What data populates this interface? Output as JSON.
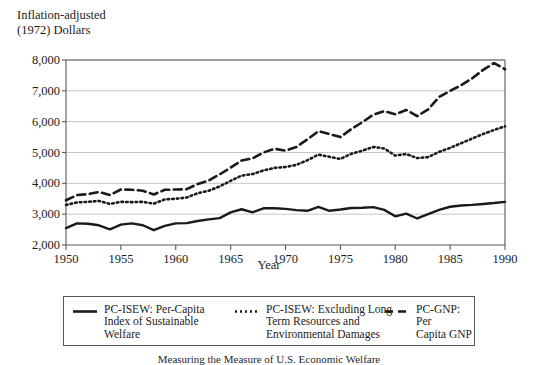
{
  "axes": {
    "ylabel_line1": "Inflation-adjusted",
    "ylabel_line2": "(1972) Dollars",
    "xlabel": "Year"
  },
  "caption": "Measuring the Measure of U.S. Economic Welfare",
  "legend": {
    "entries": [
      {
        "style": "solid",
        "label": "PC-ISEW: Per-Capita\nIndex of Sustainable\nWelfare"
      },
      {
        "style": "dotted",
        "label": "PC-ISEW: Excluding Long\nTerm Resources and\nEnvironmental Damages"
      },
      {
        "style": "dashed",
        "label": "PC-GNP: Per\nCapita GNP"
      }
    ]
  },
  "chart_data": {
    "type": "line",
    "title": "",
    "xlabel": "Year",
    "ylabel": "Inflation-adjusted (1972) Dollars",
    "xlim": [
      1950,
      1990
    ],
    "ylim": [
      2000,
      8000
    ],
    "xticks": [
      1950,
      1955,
      1960,
      1965,
      1970,
      1975,
      1980,
      1985,
      1990
    ],
    "yticks": [
      2000,
      3000,
      4000,
      5000,
      6000,
      7000,
      8000
    ],
    "ytick_labels": [
      "2,000",
      "3,000",
      "4,000",
      "5,000",
      "6,000",
      "7,000",
      "8,000"
    ],
    "grid": true,
    "grid_axis": "y",
    "legend_position": "below",
    "x": [
      1950,
      1951,
      1952,
      1953,
      1954,
      1955,
      1956,
      1957,
      1958,
      1959,
      1960,
      1961,
      1962,
      1963,
      1964,
      1965,
      1966,
      1967,
      1968,
      1969,
      1970,
      1971,
      1972,
      1973,
      1974,
      1975,
      1976,
      1977,
      1978,
      1979,
      1980,
      1981,
      1982,
      1983,
      1984,
      1985,
      1986,
      1987,
      1988,
      1989,
      1990
    ],
    "series": [
      {
        "name": "PC-ISEW: Per-Capita Index of Sustainable Welfare",
        "style": "solid",
        "color": "#1a1a1a",
        "values": [
          2550,
          2700,
          2690,
          2640,
          2510,
          2660,
          2700,
          2640,
          2480,
          2620,
          2700,
          2710,
          2780,
          2830,
          2870,
          3060,
          3160,
          3060,
          3190,
          3190,
          3170,
          3130,
          3110,
          3240,
          3110,
          3150,
          3200,
          3210,
          3230,
          3140,
          2930,
          3020,
          2860,
          3000,
          3140,
          3240,
          3280,
          3300,
          3330,
          3360,
          3400
        ]
      },
      {
        "name": "PC-ISEW: Excluding Long Term Resources and Environmental Damages",
        "style": "dotted",
        "color": "#1a1a1a",
        "values": [
          3300,
          3380,
          3400,
          3430,
          3330,
          3400,
          3390,
          3400,
          3340,
          3480,
          3500,
          3540,
          3680,
          3760,
          3900,
          4080,
          4250,
          4300,
          4420,
          4500,
          4530,
          4600,
          4750,
          4930,
          4860,
          4790,
          4960,
          5060,
          5180,
          5130,
          4900,
          4950,
          4820,
          4850,
          5020,
          5150,
          5300,
          5450,
          5600,
          5730,
          5850
        ]
      },
      {
        "name": "PC-GNP: Per Capita GNP",
        "style": "dashed",
        "color": "#1a1a1a",
        "values": [
          3450,
          3620,
          3650,
          3720,
          3620,
          3800,
          3790,
          3760,
          3640,
          3790,
          3800,
          3810,
          3980,
          4090,
          4290,
          4510,
          4740,
          4810,
          5000,
          5120,
          5060,
          5180,
          5430,
          5690,
          5600,
          5500,
          5760,
          5980,
          6230,
          6340,
          6240,
          6380,
          6180,
          6400,
          6800,
          7000,
          7180,
          7400,
          7680,
          7900,
          7700
        ]
      }
    ]
  },
  "plot_geometry": {
    "left": 66,
    "right": 505,
    "top": 60,
    "bottom": 245
  }
}
